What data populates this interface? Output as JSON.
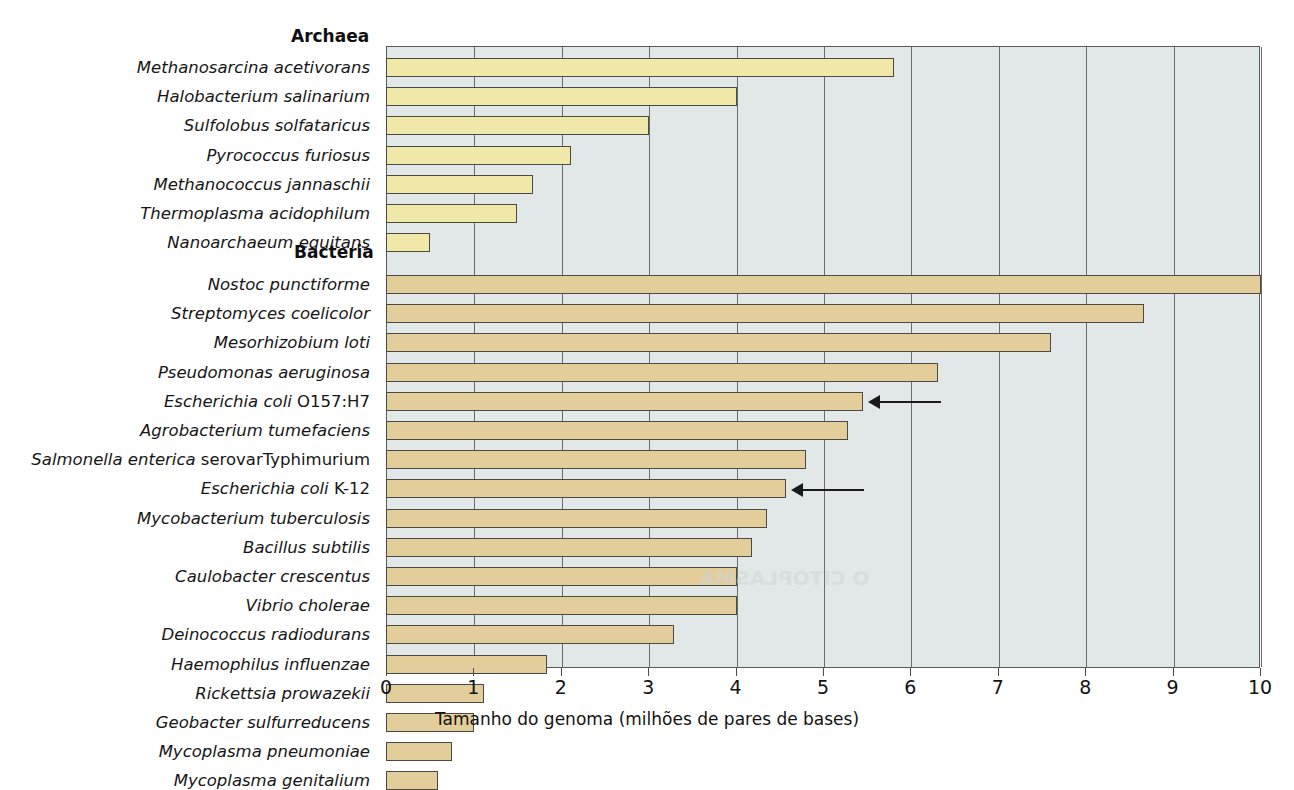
{
  "chart_data": {
    "type": "bar",
    "orientation": "horizontal",
    "title": "",
    "xlabel": "Tamanho do genoma (milhões de pares de bases)",
    "ylabel": "",
    "xlim": [
      0,
      10
    ],
    "xticks": [
      "0",
      "1",
      "2",
      "3",
      "4",
      "5",
      "6",
      "7",
      "8",
      "9",
      "10"
    ],
    "grid": true,
    "legend": "none",
    "groups": [
      {
        "name": "Archaea",
        "color": "#f0e8a8",
        "categories": [
          "Methanosarcina acetivorans",
          "Halobacterium salinarium",
          "Sulfolobus solfataricus",
          "Pyrococcus furiosus",
          "Methanococcus jannaschii",
          "Thermoplasma acidophilum",
          "Nanoarchaeum equitans"
        ],
        "values": [
          5.8,
          4.0,
          3.0,
          2.1,
          1.67,
          1.49,
          0.49
        ]
      },
      {
        "name": "Bacteria",
        "color": "#e3cd9b",
        "categories": [
          "Nostoc punctiforme",
          "Streptomyces coelicolor",
          "Mesorhizobium loti",
          "Pseudomonas aeruginosa",
          "Escherichia coli O157:H7",
          "Agrobacterium tumefaciens",
          "Salmonella enterica serovarTyphimurium",
          "Escherichia coli K-12",
          "Mycobacterium tuberculosis",
          "Bacillus subtilis",
          "Caulobacter crescentus",
          "Vibrio cholerae",
          "Deinococcus radiodurans",
          "Haemophilus influenzae",
          "Rickettsia prowazekii",
          "Geobacter sulfurreducens",
          "Mycoplasma pneumoniae",
          "Mycoplasma genitalium"
        ],
        "values": [
          10.0,
          8.66,
          7.6,
          6.3,
          5.45,
          5.28,
          4.79,
          4.57,
          4.35,
          4.18,
          4.0,
          4.0,
          3.28,
          1.83,
          1.11,
          1.0,
          0.74,
          0.58
        ]
      }
    ],
    "annotations": [
      {
        "target": "Escherichia coli O157:H7",
        "marker": "arrow-left"
      },
      {
        "target": "Escherichia coli K-12",
        "marker": "arrow-left"
      }
    ]
  },
  "labels": {
    "archaea_heading": "Archaea",
    "bacteria_heading": "Bacteria",
    "species": {
      "archaea": [
        {
          "italic": "Methanosarcina acetivorans",
          "roman": ""
        },
        {
          "italic": "Halobacterium salinarium",
          "roman": ""
        },
        {
          "italic": "Sulfolobus solfataricus",
          "roman": ""
        },
        {
          "italic": "Pyrococcus furiosus",
          "roman": ""
        },
        {
          "italic": "Methanococcus jannaschii",
          "roman": ""
        },
        {
          "italic": "Thermoplasma acidophilum",
          "roman": ""
        },
        {
          "italic": "Nanoarchaeum equitans",
          "roman": ""
        }
      ],
      "bacteria": [
        {
          "italic": "Nostoc punctiforme",
          "roman": ""
        },
        {
          "italic": "Streptomyces coelicolor",
          "roman": ""
        },
        {
          "italic": "Mesorhizobium loti",
          "roman": ""
        },
        {
          "italic": "Pseudomonas aeruginosa",
          "roman": ""
        },
        {
          "italic": "Escherichia coli ",
          "roman": "O157:H7"
        },
        {
          "italic": "Agrobacterium tumefaciens",
          "roman": ""
        },
        {
          "italic": "Salmonella enterica ",
          "roman": "serovarTyphimurium"
        },
        {
          "italic": "Escherichia coli ",
          "roman": "K-12"
        },
        {
          "italic": "Mycobacterium tuberculosis",
          "roman": ""
        },
        {
          "italic": "Bacillus subtilis",
          "roman": ""
        },
        {
          "italic": "Caulobacter crescentus",
          "roman": ""
        },
        {
          "italic": "Vibrio cholerae",
          "roman": ""
        },
        {
          "italic": "Deinococcus radiodurans",
          "roman": ""
        },
        {
          "italic": "Haemophilus influenzae",
          "roman": ""
        },
        {
          "italic": "Rickettsia prowazekii",
          "roman": ""
        },
        {
          "italic": "Geobacter sulfurreducens",
          "roman": ""
        },
        {
          "italic": "Mycoplasma pneumoniae",
          "roman": ""
        },
        {
          "italic": "Mycoplasma genitalium",
          "roman": ""
        }
      ]
    }
  },
  "ghost_text": [
    "O CITOPLASMA"
  ]
}
